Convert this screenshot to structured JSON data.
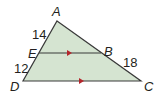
{
  "diagram": {
    "fill_color": "#d5e4d1",
    "stroke_color": "#3a3a3a",
    "arrow_color": "#b5252b",
    "vertices": {
      "A": {
        "label": "A",
        "x": 57,
        "y": 21
      },
      "B": {
        "label": "B",
        "x": 101,
        "y": 53
      },
      "C": {
        "label": "C",
        "x": 141,
        "y": 81
      },
      "D": {
        "label": "D",
        "x": 23,
        "y": 81
      },
      "E": {
        "label": "E",
        "x": 39,
        "y": 53
      }
    },
    "segment_labels": {
      "AE": "14",
      "ED": "12",
      "BC": "18"
    },
    "parallel_segments": [
      "EB",
      "DC"
    ]
  }
}
